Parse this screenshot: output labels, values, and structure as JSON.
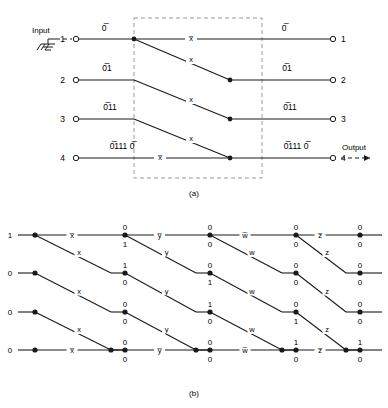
{
  "figure": {
    "captions": {
      "a": "(a)",
      "b": "(b)"
    },
    "panel_a": {
      "input_label": "Input",
      "output_label": "Output",
      "ground_icon": "ground-symbol",
      "input_terminals": [
        "1",
        "2",
        "3",
        "4"
      ],
      "output_terminals": [
        "1",
        "2",
        "3",
        "4"
      ],
      "left_state_labels": [
        "0̅",
        "0̅1",
        "0̅11",
        "0̅111 0̅"
      ],
      "right_state_labels": [
        "0̅",
        "0̅1",
        "0̅11",
        "0̅111 0̅"
      ],
      "horizontal_edge_labels": [
        "x̅",
        "x̅"
      ],
      "diagonal_edge_labels": [
        "x",
        "x",
        "x"
      ],
      "dashed_box": "trellis-stage-boundary"
    },
    "panel_b": {
      "inputs": [
        "1",
        "0",
        "0",
        "0"
      ],
      "stages": [
        {
          "variable": "x",
          "horizontal_label_top": "x̅",
          "horizontal_label_bottom": "x̅",
          "diagonal_label": "x",
          "node_values_upper": [
            "0",
            "1",
            "0",
            "0"
          ],
          "node_values_lower": [
            "1",
            "0",
            "0",
            "0"
          ]
        },
        {
          "variable": "y",
          "horizontal_label_top": "y̅",
          "horizontal_label_bottom": "y̅",
          "diagonal_label": "y",
          "node_values_upper": [
            "0",
            "0",
            "1",
            "0"
          ],
          "node_values_lower": [
            "0",
            "1",
            "0",
            "0"
          ]
        },
        {
          "variable": "w",
          "horizontal_label_top": "w̅",
          "horizontal_label_bottom": "w̅",
          "diagonal_label": "w",
          "node_values_upper": [
            "0",
            "0",
            "0",
            "1"
          ],
          "node_values_lower": [
            "0",
            "0",
            "1",
            "0"
          ]
        },
        {
          "variable": "z",
          "horizontal_label_top": "z̅",
          "horizontal_label_bottom": "z̅",
          "diagonal_label": "z",
          "node_values_upper": [
            "0",
            "0",
            "0",
            "1"
          ],
          "node_values_lower": [
            "0",
            "0",
            "0",
            "0"
          ]
        }
      ]
    },
    "colors": {
      "line": "#1a1a1a",
      "dashed": "#999999",
      "text": "#000000",
      "background": "#ffffff"
    }
  }
}
